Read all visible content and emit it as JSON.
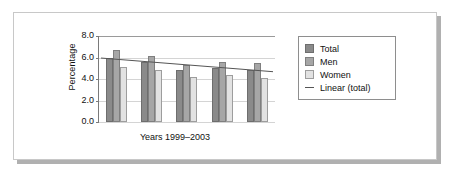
{
  "chart_data": {
    "type": "bar",
    "title": "",
    "xlabel": "Years 1999–2003",
    "ylabel": "Percentage",
    "categories": [
      "1999",
      "2000",
      "2001",
      "2002",
      "2003"
    ],
    "ylim": [
      0.0,
      8.0
    ],
    "yticks": [
      "0.0",
      "2.0",
      "4.0",
      "6.0",
      "8.0"
    ],
    "ytick_values": [
      0.0,
      2.0,
      4.0,
      6.0,
      8.0
    ],
    "grid": true,
    "legend_position": "right",
    "series": [
      {
        "name": "Total",
        "color": "#8a8a8a",
        "values": [
          6.0,
          5.6,
          4.8,
          5.0,
          4.8
        ]
      },
      {
        "name": "Men",
        "color": "#a6a6a6",
        "values": [
          6.7,
          6.1,
          5.3,
          5.6,
          5.5
        ]
      },
      {
        "name": "Women",
        "color": "#e2e2e2",
        "values": [
          5.1,
          4.8,
          4.2,
          4.4,
          4.1
        ]
      }
    ],
    "trendline": {
      "name": "Linear (total)",
      "color": "#555555",
      "start_value": 5.95,
      "end_value": 4.68
    },
    "legend": [
      {
        "label": "Total",
        "marker": "swatch",
        "color": "#8a8a8a"
      },
      {
        "label": "Men",
        "marker": "swatch",
        "color": "#a6a6a6"
      },
      {
        "label": "Women",
        "marker": "swatch",
        "color": "#e2e2e2"
      },
      {
        "label": "Linear (total)",
        "marker": "line",
        "color": "#555555"
      }
    ]
  }
}
